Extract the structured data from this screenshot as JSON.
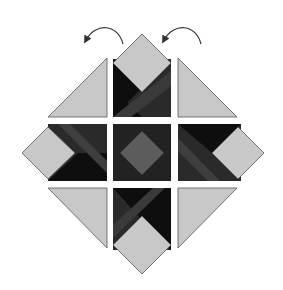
{
  "diagram": {
    "colors": {
      "background": "#ffffff",
      "light": "#c8c8c8",
      "medium": "#5c5c5c",
      "dark": "#2a2a2a",
      "black": "#0e0e0e",
      "stroke": "#555555",
      "arrow": "#333333"
    },
    "arrows": [
      {
        "name": "left-rotate-arrow",
        "direction": "counter-clockwise"
      },
      {
        "name": "right-rotate-arrow",
        "direction": "counter-clockwise"
      }
    ],
    "units": [
      {
        "position": "top-left",
        "type": "light corner triangle"
      },
      {
        "position": "top-center",
        "type": "strip block with light point up"
      },
      {
        "position": "top-right",
        "type": "light corner triangle"
      },
      {
        "position": "middle-left",
        "type": "strip block with light point left"
      },
      {
        "position": "center",
        "type": "dark square with medium diamond"
      },
      {
        "position": "middle-right",
        "type": "strip block with light point right"
      },
      {
        "position": "bottom-left",
        "type": "light corner triangle"
      },
      {
        "position": "bottom-center",
        "type": "strip block with light point down"
      },
      {
        "position": "bottom-right",
        "type": "light corner triangle"
      }
    ]
  }
}
